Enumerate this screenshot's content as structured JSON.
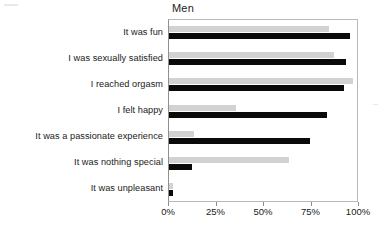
{
  "chart_data": {
    "type": "bar",
    "orientation": "horizontal",
    "title": "Men",
    "xlabel": "",
    "ylabel": "",
    "xlim": [
      0,
      100
    ],
    "xticks": [
      0,
      25,
      50,
      75,
      100
    ],
    "xtick_labels": [
      "0%",
      "25%",
      "50%",
      "75%",
      "100%"
    ],
    "grid": false,
    "legend_position": "bottom-right",
    "categories": [
      "It was fun",
      "I was sexually satisfied",
      "I reached orgasm",
      "I felt happy",
      "It was a passionate experience",
      "It was nothing special",
      "It was unpleasant"
    ],
    "series": [
      {
        "name": "masturbation",
        "color": "#d2d2d2",
        "values": [
          84,
          87,
          97,
          35,
          13,
          63,
          2
        ]
      },
      {
        "name": "coitus",
        "color": "#0a0a0a",
        "values": [
          95,
          93,
          92,
          83,
          74,
          12,
          2
        ]
      }
    ]
  },
  "legend": {
    "items": [
      {
        "label": "masturbation",
        "color": "#d2d2d2"
      },
      {
        "label": "coitus",
        "color": "#0a0a0a"
      }
    ]
  }
}
